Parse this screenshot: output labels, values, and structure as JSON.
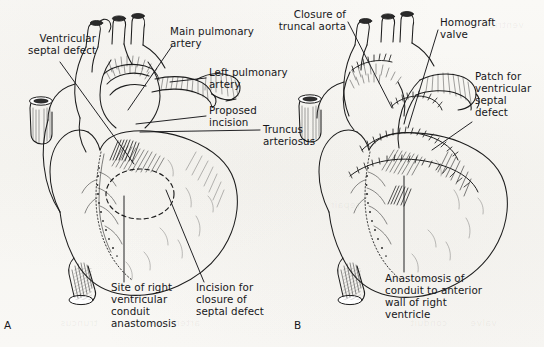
{
  "figure": {
    "background_color": "#f8f7f4",
    "ink_color": "#1a1a1a",
    "panels": [
      {
        "id": "A",
        "letter": "A",
        "caption_topic": "Preoperative anatomy of truncus arteriosus with proposed incisions"
      },
      {
        "id": "B",
        "letter": "B",
        "caption_topic": "Completed repair with homograft valved conduit and VSD patch"
      }
    ]
  },
  "panel_a": {
    "letter": "A",
    "labels": {
      "ventricular_septal_defect": "Ventricular\nseptal defect",
      "main_pulmonary_artery": "Main pulmonary\nartery",
      "left_pulmonary_artery": "Left pulmonary\nartery",
      "proposed_incision": "Proposed\nincision",
      "truncus_arteriosus": "Truncus\narteriosus",
      "site_of_right_ventricular_conduit_anastomosis": "Site of right\nventricular\nconduit\nanastomosis",
      "incision_for_closure_of_septal_defect": "Incision for\nclosure of\nseptal defect"
    }
  },
  "panel_b": {
    "letter": "B",
    "labels": {
      "closure_of_truncal_aorta": "Closure of\ntruncal aorta",
      "homograft_valve": "Homograft\nvalve",
      "patch_for_ventricular_septal_defect": "Patch for\nventricular\nseptal\ndefect",
      "anastomosis_of_conduit": "Anastomosis of\nconduit to anterior\nwall of right\nventricle"
    }
  },
  "bleed_through": {
    "items": [
      "truncus",
      "arteriosus",
      "conduit",
      "valve",
      "repair",
      "ventricle"
    ]
  }
}
